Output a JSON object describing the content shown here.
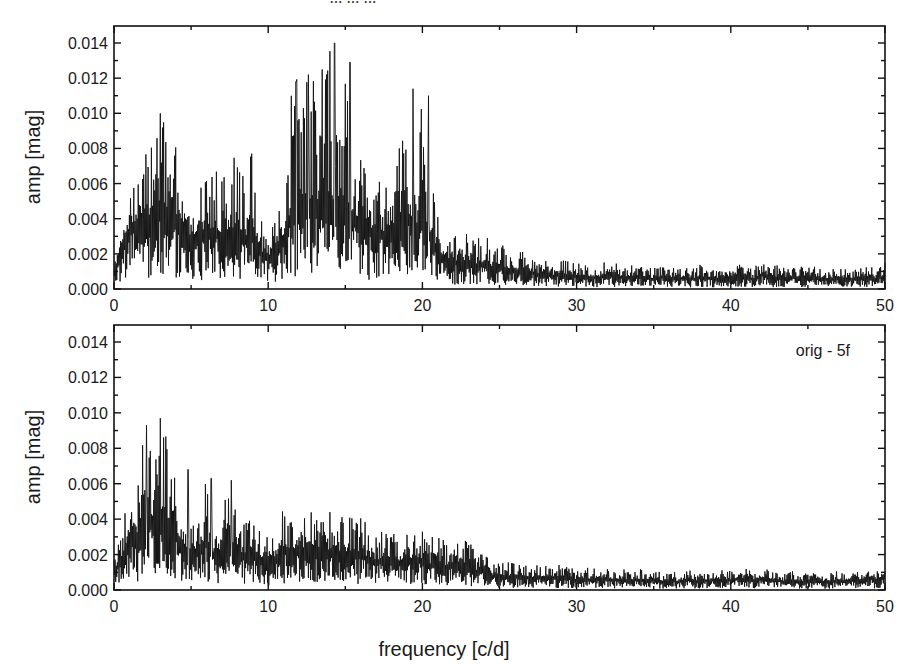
{
  "figure": {
    "cut_off_title": "... ... ...",
    "xlabel": "frequency [c/d]"
  },
  "chart_data": [
    {
      "type": "line",
      "panel": "top",
      "title": "",
      "xlabel": "",
      "ylabel": "amp [mag]",
      "xlim": [
        0,
        50
      ],
      "ylim": [
        0,
        0.015
      ],
      "xticks": [
        0,
        10,
        20,
        30,
        40,
        50
      ],
      "xtick_labels": [
        "0",
        "10",
        "20",
        "30",
        "40",
        "50"
      ],
      "yticks": [
        0.0,
        0.002,
        0.004,
        0.006,
        0.008,
        0.01,
        0.012,
        0.014
      ],
      "ytick_labels": [
        "0.000",
        "0.002",
        "0.004",
        "0.006",
        "0.008",
        "0.010",
        "0.012",
        "0.014"
      ],
      "grid": false,
      "annotation": "",
      "series": [
        {
          "name": "amplitude spectrum (original)",
          "x_step": 0.5,
          "x_start": 0,
          "peak_envelope": [
            0.0015,
            0.003,
            0.005,
            0.0065,
            0.0088,
            0.0085,
            0.01,
            0.0088,
            0.0085,
            0.005,
            0.0045,
            0.0058,
            0.0065,
            0.007,
            0.0062,
            0.007,
            0.0087,
            0.0065,
            0.0085,
            0.0045,
            0.003,
            0.0045,
            0.005,
            0.0118,
            0.0122,
            0.0125,
            0.013,
            0.0118,
            0.014,
            0.0095,
            0.0129,
            0.0082,
            0.0075,
            0.0065,
            0.0067,
            0.0065,
            0.0075,
            0.0095,
            0.0114,
            0.0075,
            0.011,
            0.0072,
            0.0045,
            0.0035,
            0.003,
            0.0032,
            0.0035,
            0.0028,
            0.0032,
            0.0025,
            0.0028,
            0.0025,
            0.0022,
            0.0023,
            0.002,
            0.0018,
            0.002,
            0.0015,
            0.0018,
            0.0016,
            0.0015,
            0.0016,
            0.0014,
            0.0014,
            0.0016,
            0.0015,
            0.0013,
            0.0014,
            0.0016,
            0.0013,
            0.0012,
            0.0013,
            0.0014,
            0.0012,
            0.0013,
            0.0012,
            0.0014,
            0.0013,
            0.0012,
            0.0013,
            0.0014,
            0.0015,
            0.0013,
            0.0012,
            0.0018,
            0.0013,
            0.0014,
            0.0012,
            0.0014,
            0.0013,
            0.0012,
            0.0014,
            0.0011,
            0.0012,
            0.0013,
            0.0012,
            0.0011,
            0.0013,
            0.0013,
            0.0012,
            0.0016
          ],
          "mean_level": [
            0.001,
            0.0025,
            0.0035,
            0.004,
            0.0045,
            0.004,
            0.0048,
            0.004,
            0.0042,
            0.0032,
            0.003,
            0.0032,
            0.0034,
            0.0035,
            0.0032,
            0.0034,
            0.0036,
            0.003,
            0.0032,
            0.0022,
            0.0018,
            0.0026,
            0.003,
            0.0045,
            0.005,
            0.005,
            0.0052,
            0.005,
            0.0055,
            0.0045,
            0.005,
            0.0042,
            0.0038,
            0.0035,
            0.0034,
            0.0033,
            0.0035,
            0.004,
            0.0045,
            0.0035,
            0.0042,
            0.0032,
            0.0022,
            0.0018,
            0.0016,
            0.0016,
            0.0017,
            0.0014,
            0.0015,
            0.0013,
            0.0013,
            0.0012,
            0.0011,
            0.0011,
            0.001,
            0.0009,
            0.001,
            0.0008,
            0.0009,
            0.0008,
            0.0008,
            0.0008,
            0.0007,
            0.0007,
            0.0008,
            0.0008,
            0.0007,
            0.0007,
            0.0008,
            0.0007,
            0.0006,
            0.0007,
            0.0007,
            0.0006,
            0.0007,
            0.0006,
            0.0007,
            0.0007,
            0.0006,
            0.0007,
            0.0007,
            0.0008,
            0.0007,
            0.0006,
            0.0009,
            0.0007,
            0.0007,
            0.0006,
            0.0007,
            0.0007,
            0.0006,
            0.0007,
            0.0006,
            0.0006,
            0.0007,
            0.0006,
            0.0006,
            0.0007,
            0.0007,
            0.0006,
            0.0008
          ]
        }
      ],
      "notable_peaks": [
        {
          "x": 3.0,
          "y": 0.01
        },
        {
          "x": 11.8,
          "y": 0.0118
        },
        {
          "x": 12.6,
          "y": 0.0122
        },
        {
          "x": 13.5,
          "y": 0.0125
        },
        {
          "x": 14.3,
          "y": 0.014
        },
        {
          "x": 15.3,
          "y": 0.0129
        },
        {
          "x": 19.4,
          "y": 0.0114
        },
        {
          "x": 20.4,
          "y": 0.011
        }
      ]
    },
    {
      "type": "line",
      "panel": "bottom",
      "title": "",
      "xlabel": "frequency [c/d]",
      "ylabel": "amp [mag]",
      "xlim": [
        0,
        50
      ],
      "ylim": [
        0,
        0.015
      ],
      "xticks": [
        0,
        10,
        20,
        30,
        40,
        50
      ],
      "xtick_labels": [
        "0",
        "10",
        "20",
        "30",
        "40",
        "50"
      ],
      "yticks": [
        0.0,
        0.002,
        0.004,
        0.006,
        0.008,
        0.01,
        0.012,
        0.014
      ],
      "ytick_labels": [
        "0.000",
        "0.002",
        "0.004",
        "0.006",
        "0.008",
        "0.010",
        "0.012",
        "0.014"
      ],
      "grid": false,
      "annotation": "orig - 5f",
      "series": [
        {
          "name": "amplitude spectrum (orig - 5f prewhitened)",
          "x_step": 0.5,
          "x_start": 0,
          "peak_envelope": [
            0.002,
            0.003,
            0.0063,
            0.0055,
            0.0093,
            0.0082,
            0.0097,
            0.0085,
            0.0068,
            0.005,
            0.004,
            0.0045,
            0.0063,
            0.0035,
            0.0045,
            0.0062,
            0.004,
            0.0038,
            0.0045,
            0.0033,
            0.003,
            0.0035,
            0.0048,
            0.0045,
            0.0046,
            0.0048,
            0.0047,
            0.0043,
            0.0044,
            0.0042,
            0.0044,
            0.004,
            0.0043,
            0.0035,
            0.0033,
            0.0035,
            0.0034,
            0.0032,
            0.0036,
            0.0034,
            0.0036,
            0.003,
            0.0032,
            0.0028,
            0.0031,
            0.0028,
            0.0029,
            0.0022,
            0.0024,
            0.0016,
            0.0018,
            0.0016,
            0.0015,
            0.0016,
            0.0014,
            0.0015,
            0.0014,
            0.0013,
            0.0015,
            0.0013,
            0.0012,
            0.0013,
            0.0012,
            0.0014,
            0.0012,
            0.0011,
            0.0012,
            0.0011,
            0.0012,
            0.0011,
            0.0012,
            0.001,
            0.0011,
            0.001,
            0.0012,
            0.0011,
            0.001,
            0.0011,
            0.0012,
            0.0011,
            0.0012,
            0.0013,
            0.0012,
            0.0011,
            0.0013,
            0.0012,
            0.0011,
            0.001,
            0.0011,
            0.001,
            0.0009,
            0.001,
            0.0009,
            0.001,
            0.0011,
            0.001,
            0.0011,
            0.0012,
            0.0013,
            0.0012,
            0.0018
          ],
          "mean_level": [
            0.0012,
            0.0018,
            0.0032,
            0.003,
            0.0045,
            0.004,
            0.0046,
            0.004,
            0.0034,
            0.0026,
            0.0022,
            0.0024,
            0.003,
            0.002,
            0.0024,
            0.003,
            0.0022,
            0.002,
            0.0024,
            0.0018,
            0.0017,
            0.0019,
            0.0024,
            0.0023,
            0.0024,
            0.0024,
            0.0024,
            0.0022,
            0.0023,
            0.0022,
            0.0022,
            0.0021,
            0.0022,
            0.0018,
            0.0017,
            0.0018,
            0.0017,
            0.0016,
            0.0018,
            0.0017,
            0.0018,
            0.0015,
            0.0016,
            0.0014,
            0.0015,
            0.0014,
            0.0014,
            0.0011,
            0.0012,
            0.0008,
            0.0009,
            0.0008,
            0.0008,
            0.0008,
            0.0007,
            0.0008,
            0.0007,
            0.0007,
            0.0008,
            0.0007,
            0.0006,
            0.0007,
            0.0006,
            0.0007,
            0.0006,
            0.0006,
            0.0006,
            0.0006,
            0.0006,
            0.0006,
            0.0006,
            0.0005,
            0.0006,
            0.0005,
            0.0006,
            0.0006,
            0.0005,
            0.0006,
            0.0006,
            0.0006,
            0.0006,
            0.0007,
            0.0006,
            0.0006,
            0.0007,
            0.0006,
            0.0006,
            0.0005,
            0.0006,
            0.0005,
            0.0005,
            0.0005,
            0.0005,
            0.0005,
            0.0006,
            0.0005,
            0.0006,
            0.0006,
            0.0007,
            0.0006,
            0.0009
          ]
        }
      ],
      "notable_peaks": [
        {
          "x": 2.1,
          "y": 0.0093
        },
        {
          "x": 3.0,
          "y": 0.0097
        },
        {
          "x": 4.8,
          "y": 0.0068
        },
        {
          "x": 6.3,
          "y": 0.0063
        },
        {
          "x": 7.6,
          "y": 0.0062
        }
      ]
    }
  ]
}
